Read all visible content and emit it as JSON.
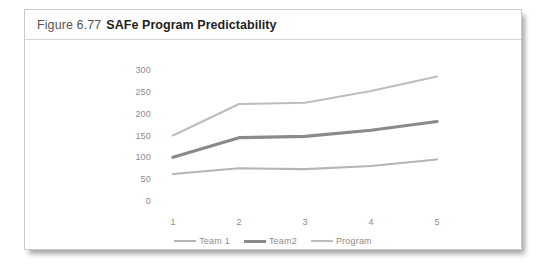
{
  "figure": {
    "number": "Figure 6.77",
    "title": "SAFe Program Predictability"
  },
  "chart_data": {
    "type": "line",
    "title": "SAFe Program Predictability",
    "xlabel": "",
    "ylabel": "",
    "categories": [
      "1",
      "2",
      "3",
      "4",
      "5"
    ],
    "x": [
      1,
      2,
      3,
      4,
      5
    ],
    "ylim": [
      0,
      300
    ],
    "xlim": [
      1,
      5
    ],
    "yticks": [
      0,
      50,
      100,
      150,
      200,
      250,
      300
    ],
    "ytick_labels": [
      "0",
      "50",
      "100",
      "150",
      "200",
      "250",
      "300"
    ],
    "xtick_labels": [
      "1",
      "2",
      "3",
      "4",
      "5"
    ],
    "grid": false,
    "legend_position": "bottom-center",
    "series": [
      {
        "name": "Team 1",
        "values": [
          62,
          75,
          73,
          80,
          95
        ],
        "color": "#b5b5b5",
        "width": 2.1
      },
      {
        "name": "Team2",
        "values": [
          100,
          145,
          148,
          162,
          182
        ],
        "color": "#8a8a8a",
        "width": 3.2
      },
      {
        "name": "Program",
        "values": [
          150,
          222,
          225,
          252,
          285
        ],
        "color": "#bdbdbd",
        "width": 2.1
      }
    ]
  },
  "legend": {
    "items": [
      {
        "label": "Team 1"
      },
      {
        "label": "Team2"
      },
      {
        "label": "Program"
      }
    ]
  },
  "colors": {
    "card_border": "#c9c9c9",
    "caption_rule": "#d4d4d4",
    "tick_text": "#8d8d8d",
    "title_text": "#1f1f1f",
    "number_text": "#555555",
    "background": "#ffffff"
  }
}
